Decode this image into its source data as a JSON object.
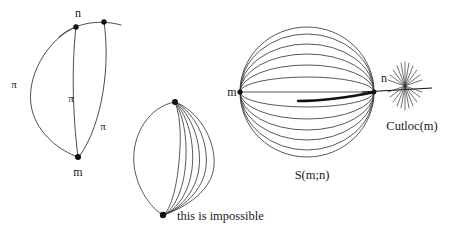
{
  "figure": {
    "background_color": "#ffffff",
    "stroke_color": "#3a3a3a",
    "accent_stroke_color": "#111111",
    "panels": [
      {
        "id": "left-panel",
        "name": "geodesic-bigon-panel",
        "description": "Two points m and n joined by several geodesic arcs each of length pi",
        "vertices": [
          {
            "name": "n",
            "label": "n",
            "x": 76,
            "y": 27
          },
          {
            "name": "m",
            "label": "m",
            "x": 78,
            "y": 157
          },
          {
            "name": "unlabeled-point",
            "label": "",
            "x": 104,
            "y": 22
          }
        ],
        "arc_labels": [
          {
            "label": "π",
            "x": 14,
            "y": 84
          },
          {
            "label": "π",
            "x": 71,
            "y": 98
          },
          {
            "label": "π",
            "x": 103,
            "y": 126
          }
        ],
        "point_labels": [
          {
            "label": "n",
            "x": 78,
            "y": 13
          },
          {
            "label": "m",
            "x": 78,
            "y": 172
          }
        ]
      },
      {
        "id": "middle-panel",
        "name": "impossible-geodesic-panel",
        "description": "Teardrop bigon with a fan of many arcs between two points",
        "vertices": [
          {
            "name": "top-vertex",
            "x": 175,
            "y": 102
          },
          {
            "name": "bottom-vertex",
            "x": 163,
            "y": 215
          }
        ],
        "caption": "this is impossible",
        "caption_x": 177,
        "caption_y": 217,
        "arc_count": 6
      },
      {
        "id": "right-panel",
        "name": "sphere-cutlocus-panel",
        "description": "Sphere S(m;n) of geodesics from m converging at n, with cut locus beyond n",
        "sphere": {
          "center_x": 307,
          "center_y": 92,
          "radius_x": 67,
          "radius_y": 65,
          "meridian_count": 9
        },
        "points": [
          {
            "name": "m",
            "label": "m",
            "x": 240,
            "y": 92
          },
          {
            "name": "n",
            "label": "n",
            "x": 375,
            "y": 92
          },
          {
            "name": "cutlocus-center",
            "label": "",
            "x": 405,
            "y": 86
          }
        ],
        "labels": [
          {
            "name": "m-label",
            "label": "m",
            "x": 232,
            "y": 92
          },
          {
            "name": "n-label",
            "label": "n",
            "x": 384,
            "y": 78
          },
          {
            "name": "cutloc-label",
            "label": "Cutloc(m)",
            "x": 412,
            "y": 126
          },
          {
            "name": "sphere-label",
            "label": "S(m;n)",
            "x": 312,
            "y": 175
          }
        ],
        "cutlocus_ray_count": 22
      }
    ]
  }
}
